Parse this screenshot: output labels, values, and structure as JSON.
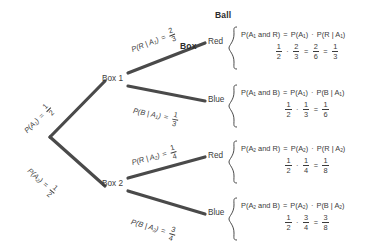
{
  "diagram": {
    "type": "probability-tree",
    "headers": {
      "box": "Box",
      "ball": "Ball"
    },
    "root": {
      "label": ""
    },
    "nodes": [
      {
        "id": "box1",
        "label": "Box 1"
      },
      {
        "id": "box2",
        "label": "Box 2"
      }
    ],
    "leaves": [
      {
        "id": "red1",
        "label": "Red"
      },
      {
        "id": "blue1",
        "label": "Blue"
      },
      {
        "id": "red2",
        "label": "Red"
      },
      {
        "id": "blue2",
        "label": "Blue"
      }
    ],
    "edge_labels": {
      "a1": {
        "name": "P(A",
        "sub": "1",
        "tail": ")",
        "eq": "=",
        "num": "1",
        "den": "2"
      },
      "a2": {
        "name": "P(A",
        "sub": "2",
        "tail": ")",
        "eq": "=",
        "num": "1",
        "den": "2"
      },
      "r_a1": {
        "name": "P(R | A",
        "sub": "1",
        "tail": ")",
        "eq": "=",
        "num": "2",
        "den": "3"
      },
      "b_a1": {
        "name": "P(B | A",
        "sub": "1",
        "tail": ")",
        "eq": "=",
        "num": "1",
        "den": "3"
      },
      "r_a2": {
        "name": "P(R | A",
        "sub": "2",
        "tail": ")",
        "eq": "=",
        "num": "1",
        "den": "4"
      },
      "b_a2": {
        "name": "P(B | A",
        "sub": "2",
        "tail": ")",
        "eq": "=",
        "num": "3",
        "den": "4"
      }
    },
    "outcomes": [
      {
        "id": "a1r",
        "line1_left": "P(A",
        "line1_left_sub": "1",
        "line1_left_tail": " and R)",
        "line1_eq": "=",
        "line1_f1": "P(A",
        "line1_f1_sub": "1",
        "line1_f1_tail": ")",
        "line1_dot": "·",
        "line1_f2": "P(R | A",
        "line1_f2_sub": "1",
        "line1_f2_tail": ")",
        "factors": [
          {
            "num": "1",
            "den": "2"
          },
          {
            "num": "2",
            "den": "3"
          },
          {
            "num": "2",
            "den": "6"
          },
          {
            "num": "1",
            "den": "3"
          }
        ],
        "ops": [
          "·",
          "=",
          "="
        ]
      },
      {
        "id": "a1b",
        "line1_left": "P(A",
        "line1_left_sub": "1",
        "line1_left_tail": " and B)",
        "line1_eq": "=",
        "line1_f1": "P(A",
        "line1_f1_sub": "1",
        "line1_f1_tail": ")",
        "line1_dot": "·",
        "line1_f2": "P(B | A",
        "line1_f2_sub": "1",
        "line1_f2_tail": ")",
        "factors": [
          {
            "num": "1",
            "den": "2"
          },
          {
            "num": "1",
            "den": "3"
          },
          {
            "num": "1",
            "den": "6"
          }
        ],
        "ops": [
          "·",
          "="
        ]
      },
      {
        "id": "a2r",
        "line1_left": "P(A",
        "line1_left_sub": "2",
        "line1_left_tail": " and R)",
        "line1_eq": "=",
        "line1_f1": "P(A",
        "line1_f1_sub": "2",
        "line1_f1_tail": ")",
        "line1_dot": "·",
        "line1_f2": "P(R | A",
        "line1_f2_sub": "2",
        "line1_f2_tail": ")",
        "factors": [
          {
            "num": "1",
            "den": "2"
          },
          {
            "num": "1",
            "den": "4"
          },
          {
            "num": "1",
            "den": "8"
          }
        ],
        "ops": [
          "·",
          "="
        ]
      },
      {
        "id": "a2b",
        "line1_left": "P(A",
        "line1_left_sub": "2",
        "line1_left_tail": " and B)",
        "line1_eq": "=",
        "line1_f1": "P(A",
        "line1_f1_sub": "2",
        "line1_f1_tail": ")",
        "line1_dot": "·",
        "line1_f2": "P(B | A",
        "line1_f2_sub": "2",
        "line1_f2_tail": ")",
        "factors": [
          {
            "num": "1",
            "den": "2"
          },
          {
            "num": "3",
            "den": "4"
          },
          {
            "num": "3",
            "den": "8"
          }
        ],
        "ops": [
          "·",
          "="
        ]
      }
    ],
    "colors": {
      "line": "#4a4a4a",
      "text": "#3b3b3b",
      "background": "#ffffff"
    }
  }
}
